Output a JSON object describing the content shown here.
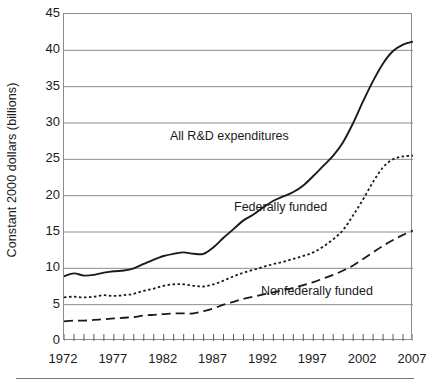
{
  "chart_data": {
    "type": "line",
    "title": "",
    "xlabel": "",
    "ylabel": "Constant 2000 dollars (billions)",
    "xlim": [
      1972,
      2007
    ],
    "ylim": [
      0,
      45
    ],
    "ytick_values": [
      0,
      5,
      10,
      15,
      20,
      25,
      30,
      35,
      40,
      45
    ],
    "ytick_labels": [
      "0",
      "5",
      "10",
      "15",
      "20",
      "25",
      "30",
      "35",
      "40",
      "45"
    ],
    "xtick_labels": [
      "1972",
      "1977",
      "1982",
      "1987",
      "1992",
      "1997",
      "2002",
      "2007"
    ],
    "xtick_values": [
      1972,
      1977,
      1982,
      1987,
      1992,
      1997,
      2002,
      2007
    ],
    "minor_xticks_every": 1,
    "grid": "horizontal",
    "legend_position": "inline-annotations",
    "x": [
      1972,
      1973,
      1974,
      1975,
      1976,
      1977,
      1978,
      1979,
      1980,
      1981,
      1982,
      1983,
      1984,
      1985,
      1986,
      1987,
      1988,
      1989,
      1990,
      1991,
      1992,
      1993,
      1994,
      1995,
      1996,
      1997,
      1998,
      1999,
      2000,
      2001,
      2002,
      2003,
      2004,
      2005,
      2006,
      2007
    ],
    "series": [
      {
        "name": "All R&D expenditures",
        "style": "solid",
        "color": "#1a1a1a",
        "values": [
          8.9,
          9.3,
          9.0,
          9.1,
          9.4,
          9.6,
          9.7,
          10.0,
          10.6,
          11.2,
          11.7,
          12.0,
          12.2,
          12.0,
          12.0,
          12.9,
          14.2,
          15.4,
          16.6,
          17.4,
          18.4,
          19.3,
          19.9,
          20.5,
          21.4,
          22.7,
          24.1,
          25.5,
          27.4,
          30.0,
          33.0,
          35.8,
          38.2,
          39.9,
          40.8,
          41.2
        ]
      },
      {
        "name": "Federally funded",
        "style": "dotted",
        "color": "#1a1a1a",
        "values": [
          6.0,
          6.1,
          6.0,
          6.1,
          6.3,
          6.2,
          6.3,
          6.5,
          6.9,
          7.2,
          7.6,
          7.8,
          7.8,
          7.6,
          7.5,
          7.8,
          8.3,
          8.9,
          9.4,
          9.8,
          10.2,
          10.6,
          10.9,
          11.3,
          11.7,
          12.2,
          13.0,
          14.0,
          15.3,
          17.3,
          19.5,
          21.9,
          23.9,
          25.0,
          25.4,
          25.5
        ]
      },
      {
        "name": "Nonfederally funded",
        "style": "dashed",
        "color": "#1a1a1a",
        "values": [
          2.7,
          2.8,
          2.8,
          2.9,
          3.0,
          3.1,
          3.2,
          3.3,
          3.5,
          3.6,
          3.7,
          3.8,
          3.8,
          3.8,
          4.1,
          4.5,
          5.0,
          5.4,
          5.8,
          6.1,
          6.4,
          6.7,
          7.0,
          7.3,
          7.7,
          8.1,
          8.6,
          9.1,
          9.7,
          10.4,
          11.3,
          12.2,
          13.1,
          13.9,
          14.6,
          15.2
        ]
      }
    ],
    "annotations": [
      {
        "text": "All R&D expenditures",
        "x_px": 170,
        "y_px": 130
      },
      {
        "text": "Federally funded",
        "x_px": 234,
        "y_px": 201
      },
      {
        "text": "Nonfederally funded",
        "x_px": 261,
        "y_px": 285
      }
    ]
  }
}
